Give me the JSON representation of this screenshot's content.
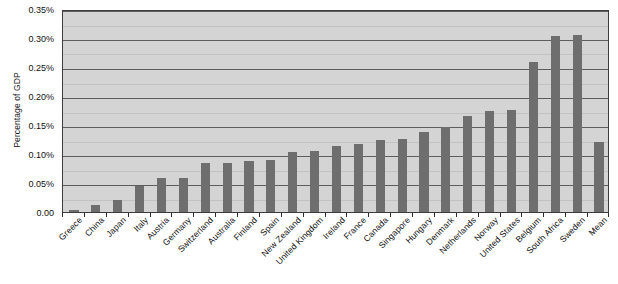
{
  "chart_data": {
    "type": "bar",
    "title": "",
    "subtitle": "",
    "xlabel": "",
    "ylabel": "Percentage of GDP",
    "ylim": [
      0,
      0.35
    ],
    "ytick_labels": [
      "0.00",
      "0.05%",
      "0.10%",
      "0.15%",
      "0.20%",
      "0.25%",
      "0.30%",
      "0.35%"
    ],
    "ytick_values": [
      0,
      0.05,
      0.1,
      0.15,
      0.2,
      0.25,
      0.3,
      0.35
    ],
    "grid": true,
    "legend": "none",
    "bar_color": "#6e6e6e",
    "plot_background": "#d4d4d4",
    "categories": [
      "Greece",
      "China",
      "Japan",
      "Italy",
      "Austria",
      "Germany",
      "Switzerland",
      "Australia",
      "Finland",
      "Spain",
      "New Zealand",
      "United Kingdom",
      "Ireland",
      "France",
      "Canada",
      "Singapore",
      "Hungary",
      "Denmark",
      "Netherlands",
      "Norway",
      "United States",
      "Belgium",
      "South Africa",
      "Sweden",
      "Mean"
    ],
    "values": [
      0.003,
      0.012,
      0.021,
      0.045,
      0.058,
      0.058,
      0.084,
      0.085,
      0.088,
      0.09,
      0.104,
      0.106,
      0.113,
      0.117,
      0.124,
      0.126,
      0.138,
      0.147,
      0.165,
      0.174,
      0.176,
      0.259,
      0.303,
      0.305,
      0.12
    ]
  }
}
